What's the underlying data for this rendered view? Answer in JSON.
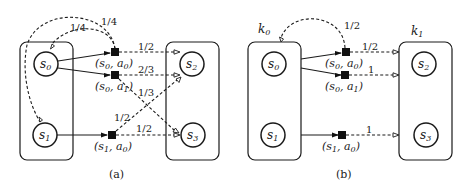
{
  "panels": [
    {
      "id": "a",
      "caption": "(a)",
      "states": [
        {
          "name": "s",
          "sub": "0"
        },
        {
          "name": "s",
          "sub": "1"
        },
        {
          "name": "s",
          "sub": "2"
        },
        {
          "name": "s",
          "sub": "3"
        }
      ],
      "actions": [
        {
          "label": "(s0, a0)",
          "s": "s",
          "s_sub": "0",
          "a": "a",
          "a_sub": "0"
        },
        {
          "label": "(s0, a1)",
          "s": "s",
          "s_sub": "0",
          "a": "a",
          "a_sub": "1"
        },
        {
          "label": "(s1, a0)",
          "s": "s",
          "s_sub": "1",
          "a": "a",
          "a_sub": "0"
        }
      ],
      "transitions": [
        {
          "from": "(s0,a0)",
          "to": "s0",
          "prob": "1/4"
        },
        {
          "from": "(s0,a0)",
          "to": "s1",
          "prob": "1/4"
        },
        {
          "from": "(s0,a0)",
          "to": "s2",
          "prob": "1/2"
        },
        {
          "from": "(s0,a1)",
          "to": "s2",
          "prob": "2/3"
        },
        {
          "from": "(s0,a1)",
          "to": "s3",
          "prob": "1/3"
        },
        {
          "from": "(s1,a0)",
          "to": "s2",
          "prob": "1/2"
        },
        {
          "from": "(s1,a0)",
          "to": "s3",
          "prob": "1/2"
        }
      ]
    },
    {
      "id": "b",
      "caption": "(b)",
      "clusters": [
        {
          "name": "k",
          "sub": "0"
        },
        {
          "name": "k",
          "sub": "1"
        }
      ],
      "states": [
        {
          "name": "s",
          "sub": "0"
        },
        {
          "name": "s",
          "sub": "1"
        },
        {
          "name": "s",
          "sub": "2"
        },
        {
          "name": "s",
          "sub": "3"
        }
      ],
      "actions": [
        {
          "label": "(s0, a0)",
          "s": "s",
          "s_sub": "0",
          "a": "a",
          "a_sub": "0"
        },
        {
          "label": "(s0, a1)",
          "s": "s",
          "s_sub": "0",
          "a": "a",
          "a_sub": "1"
        },
        {
          "label": "(s1, a0)",
          "s": "s",
          "s_sub": "1",
          "a": "a",
          "a_sub": "0"
        }
      ],
      "transitions": [
        {
          "from": "(s0,a0)",
          "to": "k0",
          "prob": "1/2"
        },
        {
          "from": "(s0,a0)",
          "to": "k1",
          "prob": "1/2"
        },
        {
          "from": "(s0,a1)",
          "to": "k1",
          "prob": "1"
        },
        {
          "from": "(s1,a0)",
          "to": "k1",
          "prob": "1"
        }
      ]
    }
  ]
}
